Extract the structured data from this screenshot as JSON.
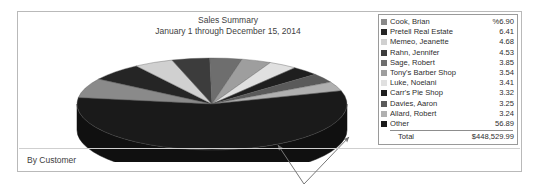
{
  "report": {
    "title_line1": "Sales Summary",
    "title_line2": "January 1 through December 15, 2014",
    "footer_label": "By Customer"
  },
  "legend": {
    "total_label": "Total",
    "total_value": "$448,529.99"
  },
  "chart_data": {
    "type": "pie",
    "title": "Sales Summary",
    "subtitle": "January 1 through December 15, 2014",
    "value_unit": "percent",
    "total_label": "Total",
    "total_value": "$448,529.99",
    "legend_position": "right",
    "three_d": true,
    "categories": [
      "Cook, Brian",
      "Pretell Real Estate",
      "Memeo, Jeanette",
      "Rahn, Jennifer",
      "Sage, Robert",
      "Tony's Barber Shop",
      "Luke, Noelani",
      "Carr's Pie Shop",
      "Davies, Aaron",
      "Allard, Robert",
      "Other"
    ],
    "values": [
      6.9,
      6.41,
      4.68,
      4.53,
      3.85,
      3.54,
      3.41,
      3.32,
      3.25,
      3.24,
      56.89
    ],
    "value_labels": [
      "%6.90",
      "6.41",
      "4.68",
      "4.53",
      "3.85",
      "3.54",
      "3.41",
      "3.32",
      "3.25",
      "3.24",
      "56.89"
    ],
    "colors": [
      "#8a8a8a",
      "#252525",
      "#d0d0d0",
      "#3c3c3c",
      "#6e6e6e",
      "#9e9e9e",
      "#e0e0e0",
      "#1f1f1f",
      "#5a5a5a",
      "#b0b0b0",
      "#1a1a1a"
    ],
    "slices": [
      {
        "label": "Cook, Brian",
        "value": 6.9,
        "value_label": "%6.90",
        "color": "#8a8a8a"
      },
      {
        "label": "Pretell Real Estate",
        "value": 6.41,
        "value_label": "6.41",
        "color": "#252525"
      },
      {
        "label": "Memeo, Jeanette",
        "value": 4.68,
        "value_label": "4.68",
        "color": "#d0d0d0"
      },
      {
        "label": "Rahn, Jennifer",
        "value": 4.53,
        "value_label": "4.53",
        "color": "#3c3c3c"
      },
      {
        "label": "Sage, Robert",
        "value": 3.85,
        "value_label": "3.85",
        "color": "#6e6e6e"
      },
      {
        "label": "Tony's Barber Shop",
        "value": 3.54,
        "value_label": "3.54",
        "color": "#9e9e9e"
      },
      {
        "label": "Luke, Noelani",
        "value": 3.41,
        "value_label": "3.41",
        "color": "#e0e0e0"
      },
      {
        "label": "Carr's Pie Shop",
        "value": 3.32,
        "value_label": "3.32",
        "color": "#1f1f1f"
      },
      {
        "label": "Davies, Aaron",
        "value": 3.25,
        "value_label": "3.25",
        "color": "#5a5a5a"
      },
      {
        "label": "Allard, Robert",
        "value": 3.24,
        "value_label": "3.24",
        "color": "#b0b0b0"
      },
      {
        "label": "Other",
        "value": 56.89,
        "value_label": "56.89",
        "color": "#1a1a1a"
      }
    ]
  }
}
